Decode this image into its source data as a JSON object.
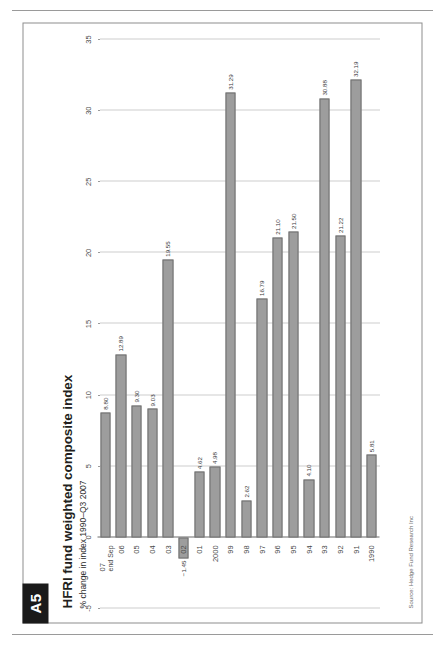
{
  "page": {
    "tab_label": "A5"
  },
  "figure": {
    "title": "HFRI fund weighted composite index",
    "subtitle": "% change in index 1990–Q3 2007",
    "source": "Source: Hedge Fund Research Inc"
  },
  "chart_data": {
    "type": "bar",
    "title": "HFRI fund weighted composite index",
    "subtitle": "% change in index 1990–Q3 2007",
    "xlabel": "",
    "ylabel": "% change in index",
    "orientation": "horizontal",
    "grid": true,
    "legend": "none",
    "ylim": [
      -5,
      35
    ],
    "ticks": [
      "-5",
      "0",
      "5",
      "10",
      "15",
      "20",
      "25",
      "30",
      "35"
    ],
    "tick_values": [
      -5,
      0,
      5,
      10,
      15,
      20,
      25,
      30,
      35
    ],
    "bar_color": "#9d9d9d",
    "bar_border_color": "#6f6f6f",
    "categories": [
      "1990",
      "91",
      "92",
      "93",
      "94",
      "95",
      "96",
      "97",
      "98",
      "99",
      "2000",
      "01",
      "02",
      "03",
      "04",
      "05",
      "06",
      "07"
    ],
    "category_sublabels": [
      "",
      "",
      "",
      "",
      "",
      "",
      "",
      "",
      "",
      "",
      "",
      "",
      "",
      "",
      "",
      "",
      "",
      "end Sep"
    ],
    "values": [
      5.81,
      32.19,
      21.22,
      30.88,
      4.1,
      21.5,
      21.1,
      16.79,
      2.62,
      31.29,
      4.98,
      4.62,
      -1.45,
      19.55,
      9.03,
      9.3,
      12.89,
      8.8
    ],
    "value_labels": [
      "5.81",
      "32.19",
      "21.22",
      "30.88",
      "4.10",
      "21.50",
      "21.10",
      "16.79",
      "2.62",
      "31.29",
      "4.98",
      "4.62",
      "−1.45",
      "19.55",
      "9.03",
      "9.30",
      "12.89",
      "8.80"
    ]
  }
}
